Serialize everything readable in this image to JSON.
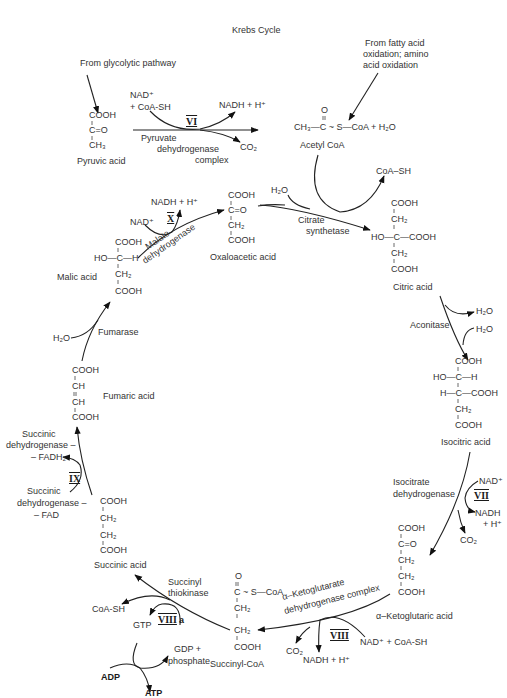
{
  "title": "Krebs Cycle",
  "sources": {
    "glycolysis": "From glycolytic pathway",
    "fatty_acid": [
      "From fatty acid",
      "oxidation; amino",
      "acid oxidation"
    ]
  },
  "compounds": {
    "pyruvic_acid": {
      "name": "Pyruvic acid",
      "formula": [
        "COOH",
        "C=O",
        "CH₃"
      ]
    },
    "acetyl_coa": {
      "name": "Acetyl CoA",
      "formula": "CH₃—C ~ S—CoA + H₂O",
      "top": "O"
    },
    "oxaloacetic_acid": {
      "name": "Oxaloacetic acid",
      "formula": [
        "COOH",
        "C=O",
        "CH₂",
        "COOH"
      ]
    },
    "citric_acid": {
      "name": "Citric acid",
      "formula": [
        "COOH",
        "CH₂",
        "HO—C—COOH",
        "CH₂",
        "COOH"
      ]
    },
    "isocitric_acid": {
      "name": "Isocitric acid",
      "formula": [
        "COOH",
        "HO—C—H",
        "H—C—COOH",
        "CH₂",
        "COOH"
      ]
    },
    "alpha_ketoglutaric_acid": {
      "name": "α–Ketoglutaric acid",
      "formula": [
        "COOH",
        "C=O",
        "CH₂",
        "CH₂",
        "COOH"
      ]
    },
    "succinyl_coa": {
      "name": "Succinyl-CoA",
      "formula": [
        "O",
        "C ~ S—CoA",
        "CH₂",
        "CH₂",
        "COOH"
      ]
    },
    "succinic_acid": {
      "name": "Succinic acid",
      "formula": [
        "COOH",
        "CH₂",
        "CH₂",
        "COOH"
      ]
    },
    "fumaric_acid": {
      "name": "Fumaric acid",
      "formula": [
        "COOH",
        "CH",
        "CH",
        "COOH"
      ]
    },
    "malic_acid": {
      "name": "Malic acid",
      "formula": [
        "COOH",
        "HO—C—H",
        "CH₂",
        "COOH"
      ]
    }
  },
  "enzymes": {
    "pyruvate_dh": [
      "Pyruvate",
      "dehydrogenase",
      "complex"
    ],
    "citrate_synthetase": [
      "Citrate",
      "synthetase"
    ],
    "aconitase": "Aconitase",
    "isocitrate_dh": [
      "Isocitrate",
      "dehydrogenase"
    ],
    "akg_dh": [
      "α–Ketoglutarate",
      "dehydrogenase complex"
    ],
    "succinyl_thiokinase": [
      "Succinyl",
      "thiokinase"
    ],
    "succinic_dh_fadh2": [
      "Succinic",
      "dehydrogenase –",
      "– FADH₂"
    ],
    "succinic_dh_fad": [
      "Succinic",
      "dehydrogenase –",
      "– FAD"
    ],
    "fumarase": "Fumarase",
    "malate_dh": [
      "Malate",
      "dehydrogenase"
    ]
  },
  "steps": {
    "VI": "VI",
    "VII": "VII",
    "VIII": "VIII",
    "VIIIa": "VIII",
    "VIIIa_suffix": "a",
    "IX": "IX",
    "X": "X"
  },
  "cofactors": {
    "pdh_in": [
      "NAD⁺",
      "+ CoA-SH"
    ],
    "pdh_out": "NADH + H⁺",
    "pdh_co2": "CO₂",
    "cs_h2o": "H₂O",
    "cs_coash": "CoA–SH",
    "acon_h2o_out": "H₂O",
    "acon_h2o_in": "H₂O",
    "idh_nad": "NAD⁺",
    "idh_nadh": [
      "NADH",
      "+ H⁺"
    ],
    "idh_co2": "CO₂",
    "akg_in": "NAD⁺ + CoA-SH",
    "akg_nadh": "NADH + H⁺",
    "akg_co2": "CO₂",
    "stk_coash": "CoA-SH",
    "stk_gtp": "GTP",
    "stk_gdp": [
      "GDP +",
      "phosphate"
    ],
    "stk_adp": "ADP",
    "stk_atp": "ATP",
    "fum_h2o": "H₂O",
    "mdh_nad": "NAD⁺",
    "mdh_nadh": "NADH + H⁺"
  }
}
